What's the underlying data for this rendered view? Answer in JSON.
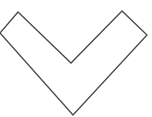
{
  "icon": {
    "name": "chevron-down-icon",
    "stroke_color": "#4a4a4a",
    "fill_color": "#ffffff",
    "points": "18,12 71,63 122,11 147,35 73,115 0,33"
  }
}
